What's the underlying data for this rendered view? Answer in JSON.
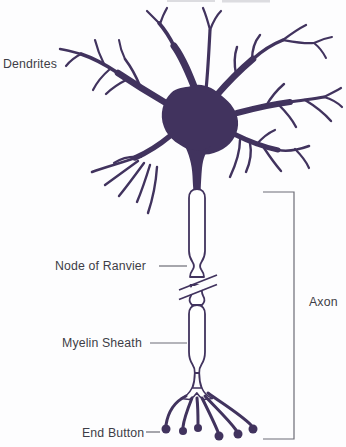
{
  "labels": {
    "dendrites": "Dendrites",
    "node_of_ranvier": "Node of Ranvier",
    "myelin_sheath": "Myelin Sheath",
    "end_button": "End Button",
    "axon": "Axon"
  },
  "colors": {
    "neuron": "#41335e",
    "leader_line": "#6d6d76",
    "label_text": "#3d3d47",
    "background": "#fdfdfe",
    "top_remnant": "#dcdce0"
  }
}
